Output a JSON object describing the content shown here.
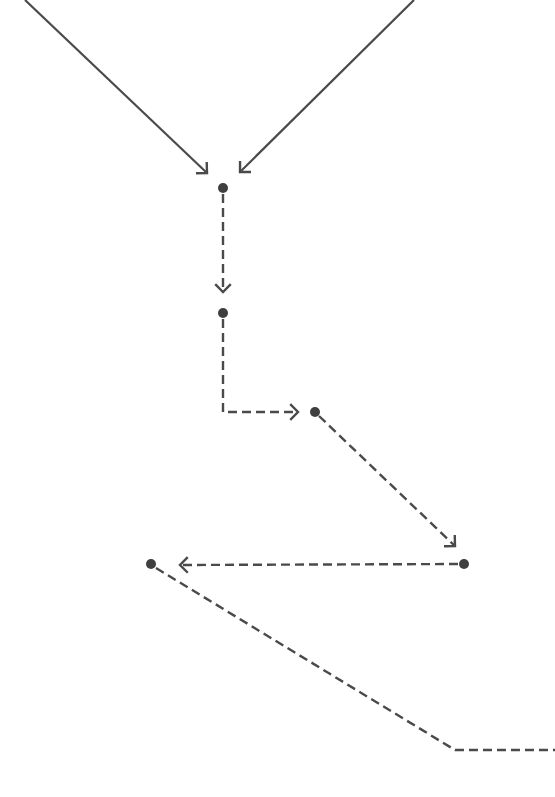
{
  "diagram": {
    "width": 555,
    "height": 797,
    "background": "#ffffff",
    "stroke_color": "#4a4a4a",
    "node_color": "#3f3f3f",
    "node_radius": 5,
    "arrowhead_size": 11,
    "nodes": [
      {
        "id": "n1",
        "x": 223,
        "y": 188
      },
      {
        "id": "n2",
        "x": 223,
        "y": 313
      },
      {
        "id": "n3",
        "x": 315,
        "y": 412
      },
      {
        "id": "n4",
        "x": 464,
        "y": 564
      },
      {
        "id": "n5",
        "x": 151,
        "y": 564
      }
    ],
    "edges": [
      {
        "id": "incoming-left",
        "style": "solid",
        "points": [
          [
            25,
            0
          ],
          [
            207,
            173
          ]
        ],
        "arrow_end": true
      },
      {
        "id": "incoming-right",
        "style": "solid",
        "points": [
          [
            414,
            0
          ],
          [
            240,
            172
          ]
        ],
        "arrow_end": true
      },
      {
        "id": "n1-to-n2",
        "style": "dashed",
        "points": [
          [
            223,
            194
          ],
          [
            223,
            292
          ]
        ],
        "arrow_end": true
      },
      {
        "id": "n2-to-n3",
        "style": "dashed",
        "points": [
          [
            223,
            319
          ],
          [
            223,
            412
          ],
          [
            298,
            412
          ]
        ],
        "arrow_end": true
      },
      {
        "id": "n3-to-n4",
        "style": "dashed",
        "points": [
          [
            319,
            416
          ],
          [
            455,
            546
          ]
        ],
        "arrow_end": true
      },
      {
        "id": "n4-to-n5",
        "style": "dashed",
        "points": [
          [
            458,
            564
          ],
          [
            180,
            565
          ]
        ],
        "arrow_end": true
      },
      {
        "id": "n5-outgoing",
        "style": "dashed",
        "points": [
          [
            156,
            568
          ],
          [
            455,
            750
          ],
          [
            555,
            750
          ]
        ],
        "arrow_end": false
      }
    ]
  }
}
